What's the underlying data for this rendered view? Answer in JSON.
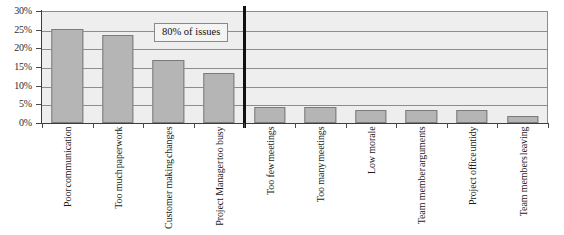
{
  "chart_data": {
    "type": "bar",
    "title": "",
    "subtitle": "",
    "xlabel": "",
    "ylabel": "",
    "ylim": [
      0,
      30
    ],
    "y_tick_labels": [
      "0%",
      "5%",
      "10%",
      "15%",
      "20%",
      "25%",
      "30%"
    ],
    "y_ticks": [
      0,
      5,
      10,
      15,
      20,
      25,
      30
    ],
    "grid": true,
    "legend": false,
    "categories": [
      "Poor communication",
      "Too much paperwork",
      "Customer making changes",
      "Project Manager too busy",
      "Too few meetings",
      "Too many meetings",
      "Low morale",
      "Team member arguments",
      "Project office untidy",
      "Team members leaving"
    ],
    "category_lines": [
      [
        "Poor",
        "communication"
      ],
      [
        "Too much",
        "paperwork"
      ],
      [
        "Customer making",
        "changes"
      ],
      [
        "Project Manager",
        "too busy"
      ],
      [
        "Too few",
        "meetings"
      ],
      [
        "Too many",
        "meetings"
      ],
      [
        "Low morale"
      ],
      [
        "Team member",
        "arguments"
      ],
      [
        "Project office",
        "untidy"
      ],
      [
        "Team members",
        "leaving"
      ]
    ],
    "values": [
      25.3,
      23.5,
      17.0,
      13.4,
      4.3,
      4.3,
      3.5,
      3.5,
      3.5,
      1.8
    ],
    "annotations": [
      {
        "text": "80% of issues",
        "x_pct": 28.5,
        "y_value": 26.5
      }
    ],
    "divider": {
      "after_category_index": 3,
      "color": "#111111"
    },
    "colors": {
      "bar_fill": "#b5b5b5",
      "bar_border": "#7b7b7b",
      "plot_background": "#eeeeee",
      "gridline": "#8d8d8d",
      "axis": "#3d3d3d",
      "text": "#1b1b1b"
    }
  }
}
